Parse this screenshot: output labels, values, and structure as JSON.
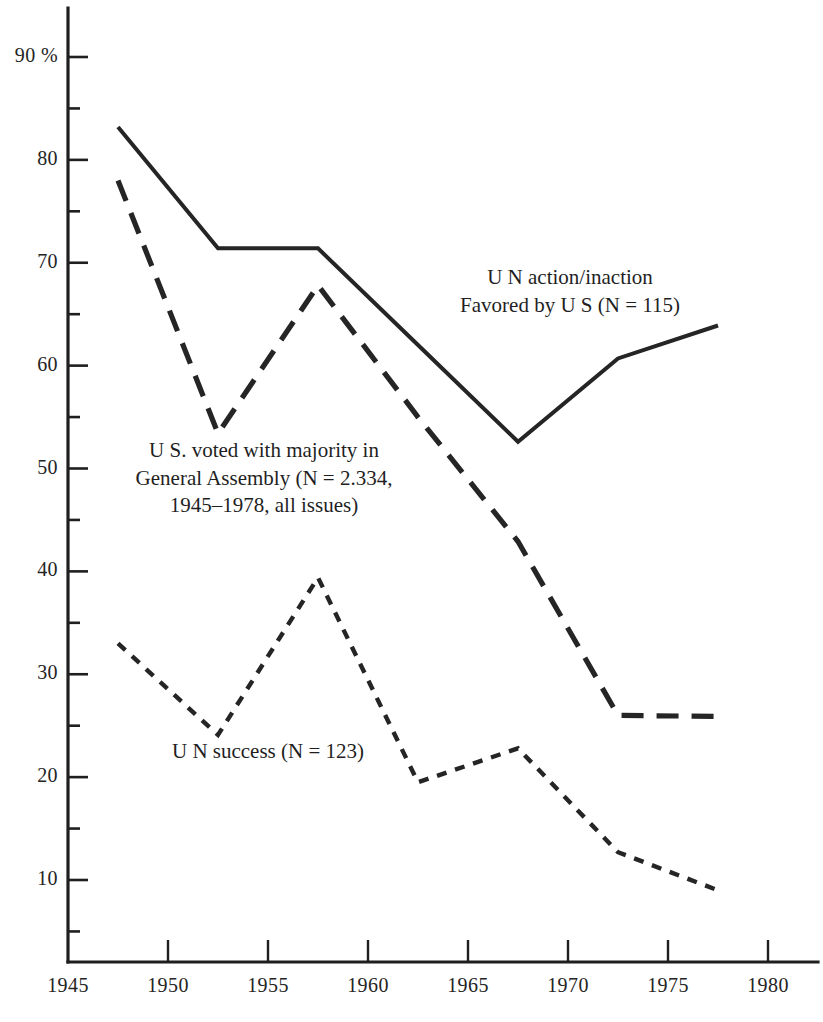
{
  "chart_data": {
    "type": "line",
    "title": "",
    "subtitle": "",
    "xlabel": "",
    "ylabel": "",
    "xlim": [
      1945,
      1981
    ],
    "ylim": [
      0,
      92
    ],
    "grid": false,
    "legend_position": "inline-annotations",
    "x_ticks": [
      1945,
      1950,
      1955,
      1960,
      1965,
      1970,
      1975,
      1980
    ],
    "x_tick_labels": [
      "1945",
      "1950",
      "1955",
      "1960",
      "1965",
      "1970",
      "1975",
      "1980"
    ],
    "y_ticks": [
      10,
      20,
      30,
      40,
      50,
      60,
      70,
      80,
      90
    ],
    "y_tick_labels": [
      "10",
      "20",
      "30",
      "40",
      "50",
      "60",
      "70",
      "80",
      "90 %"
    ],
    "y_minor_ticks": [
      5,
      15,
      25,
      35,
      45,
      55,
      65,
      75,
      85
    ],
    "x": [
      1947.5,
      1952.5,
      1957.5,
      1962.5,
      1967.5,
      1972.5,
      1977.5
    ],
    "series": [
      {
        "name": "UN action/inaction Favored by US",
        "style": "solid",
        "values": [
          83.2,
          71.4,
          71.4,
          62.0,
          52.6,
          60.7,
          63.9
        ]
      },
      {
        "name": "US voted with majority in General Assembly",
        "style": "long-dash",
        "values": [
          78.0,
          53.4,
          67.8,
          55.0,
          42.9,
          26.0,
          25.9
        ]
      },
      {
        "name": "UN success",
        "style": "short-dash",
        "values": [
          33.0,
          24.1,
          39.4,
          19.5,
          22.8,
          12.7,
          9.0
        ]
      }
    ],
    "annotations": [
      {
        "id": "annotation-un-action",
        "lines": [
          "U N  action/inaction",
          "Favored by U S  (N =  115)"
        ]
      },
      {
        "id": "annotation-us-voted",
        "lines": [
          "U S. voted with majority in",
          "General Assembly (N =  2.334,",
          "1945–1978, all issues)"
        ]
      },
      {
        "id": "annotation-un-success",
        "lines": [
          "U N  success (N =  123)"
        ]
      }
    ]
  }
}
